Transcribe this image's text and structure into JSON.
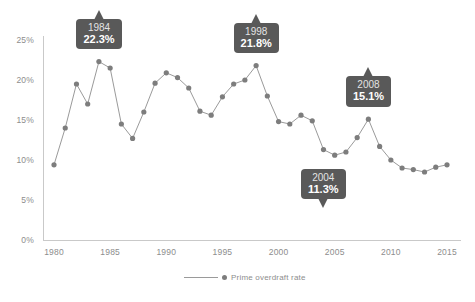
{
  "chart_data": {
    "type": "line",
    "title": "",
    "subtitle": "",
    "xlabel": "",
    "ylabel": "",
    "xlim": [
      1979,
      2016
    ],
    "ylim": [
      0,
      26
    ],
    "grid": false,
    "legend_position": "bottom-center",
    "y_ticks": [
      "0%",
      "5%",
      "10%",
      "15%",
      "20%",
      "25%"
    ],
    "y_tick_values": [
      0,
      5,
      10,
      15,
      20,
      25
    ],
    "x_ticks": [
      "1980",
      "1985",
      "1990",
      "1995",
      "2000",
      "2005",
      "2010",
      "2015"
    ],
    "x_tick_values": [
      1980,
      1985,
      1990,
      1995,
      2000,
      2005,
      2010,
      2015
    ],
    "series": [
      {
        "name": "Prime overdraft rate",
        "color": "#7d7d7d",
        "x": [
          1980,
          1981,
          1982,
          1983,
          1984,
          1985,
          1986,
          1987,
          1988,
          1989,
          1990,
          1991,
          1992,
          1993,
          1994,
          1995,
          1996,
          1997,
          1998,
          1999,
          2000,
          2001,
          2002,
          2003,
          2004,
          2005,
          2006,
          2007,
          2008,
          2009,
          2010,
          2011,
          2012,
          2013,
          2014,
          2015
        ],
        "values": [
          9.4,
          14.0,
          19.5,
          17.0,
          22.3,
          21.5,
          14.5,
          12.7,
          16.0,
          19.6,
          20.9,
          20.3,
          19.0,
          16.1,
          15.6,
          17.9,
          19.5,
          20.0,
          21.8,
          18.0,
          14.8,
          14.5,
          15.6,
          14.9,
          11.3,
          10.6,
          11.0,
          12.8,
          15.1,
          11.7,
          10.0,
          9.0,
          8.8,
          8.5,
          9.1,
          9.4
        ]
      }
    ],
    "annotations": [
      {
        "year": "1984",
        "value": "22.3%",
        "point_x": 1984,
        "point_y": 22.3,
        "placement": "above"
      },
      {
        "year": "1998",
        "value": "21.8%",
        "point_x": 1998,
        "point_y": 21.8,
        "placement": "above"
      },
      {
        "year": "2004",
        "value": "11.3%",
        "point_x": 2004,
        "point_y": 11.3,
        "placement": "below"
      },
      {
        "year": "2008",
        "value": "15.1%",
        "point_x": 2008,
        "point_y": 15.1,
        "placement": "above"
      }
    ],
    "colors": {
      "line": "#9a9a9a",
      "marker": "#7d7d7d",
      "axis": "#c9c9c9",
      "tick_text": "#8d8d8d",
      "callout_bg": "#595959",
      "callout_year_text": "#e3e3e3",
      "callout_value_text": "#ffffff",
      "background": "#ffffff"
    }
  },
  "legend": {
    "label": "Prime overdraft rate"
  },
  "y_axis": {
    "ticks": [
      {
        "label": "25%"
      },
      {
        "label": "20%"
      },
      {
        "label": "15%"
      },
      {
        "label": "10%"
      },
      {
        "label": "5%"
      },
      {
        "label": "0%"
      }
    ]
  },
  "x_axis": {
    "ticks": [
      {
        "label": "1980"
      },
      {
        "label": "1985"
      },
      {
        "label": "1990"
      },
      {
        "label": "1995"
      },
      {
        "label": "2000"
      },
      {
        "label": "2005"
      },
      {
        "label": "2010"
      },
      {
        "label": "2015"
      }
    ]
  },
  "callouts": [
    {
      "year": "1984",
      "value": "22.3%"
    },
    {
      "year": "1998",
      "value": "21.8%"
    },
    {
      "year": "2004",
      "value": "11.3%"
    },
    {
      "year": "2008",
      "value": "15.1%"
    }
  ]
}
